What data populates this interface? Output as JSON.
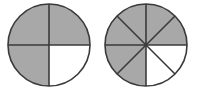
{
  "figure": {
    "background_color": "#ffffff",
    "width": 197,
    "height": 94
  },
  "style": {
    "shaded_color": "#a8a8a8",
    "unshaded_color": "#ffffff",
    "outline_color": "#3a3a3a",
    "outline_width": 1.6,
    "divider_width": 1.6
  },
  "chart_data": {
    "type": "pie",
    "xlabel": "",
    "ylabel": "",
    "legend": [
      {
        "label": "shaded",
        "color": "#a8a8a8"
      },
      {
        "label": "unshaded",
        "color": "#ffffff"
      }
    ],
    "charts": [
      {
        "name": "left-circle",
        "total_sectors": 4,
        "shaded_sectors": 3,
        "unshaded_sectors": 1,
        "fraction": "3/4",
        "value": 0.75,
        "categories": [
          "quadrant-1",
          "quadrant-2",
          "quadrant-3",
          "quadrant-4"
        ],
        "values": [
          25,
          25,
          25,
          25
        ],
        "shaded": [
          true,
          true,
          true,
          false
        ]
      },
      {
        "name": "right-circle",
        "total_sectors": 8,
        "shaded_sectors": 6,
        "unshaded_sectors": 2,
        "fraction": "6/8",
        "value": 0.75,
        "categories": [
          "eighth-1",
          "eighth-2",
          "eighth-3",
          "eighth-4",
          "eighth-5",
          "eighth-6",
          "eighth-7",
          "eighth-8"
        ],
        "values": [
          12.5,
          12.5,
          12.5,
          12.5,
          12.5,
          12.5,
          12.5,
          12.5
        ],
        "shaded": [
          true,
          true,
          false,
          false,
          true,
          true,
          true,
          true
        ]
      }
    ]
  },
  "circles": [
    {
      "id": "left-circle",
      "label": "three-fourths-circle",
      "cx": 49,
      "cy": 45,
      "r": 41,
      "sector_count": 4,
      "start_angle_deg": -90,
      "sectors": [
        {
          "id": "left-sector-1",
          "label": "top-right-quadrant",
          "shaded": true
        },
        {
          "id": "left-sector-2",
          "label": "bottom-right-quadrant",
          "shaded": false
        },
        {
          "id": "left-sector-3",
          "label": "bottom-left-quadrant",
          "shaded": true
        },
        {
          "id": "left-sector-4",
          "label": "top-left-quadrant",
          "shaded": true
        }
      ]
    },
    {
      "id": "right-circle",
      "label": "six-eighths-circle",
      "cx": 146,
      "cy": 45,
      "r": 41,
      "sector_count": 8,
      "start_angle_deg": -90,
      "sectors": [
        {
          "id": "right-sector-1",
          "label": "upper-right-eighth-a",
          "shaded": true
        },
        {
          "id": "right-sector-2",
          "label": "upper-right-eighth-b",
          "shaded": true
        },
        {
          "id": "right-sector-3",
          "label": "lower-right-eighth-a",
          "shaded": false
        },
        {
          "id": "right-sector-4",
          "label": "lower-right-eighth-b",
          "shaded": false
        },
        {
          "id": "right-sector-5",
          "label": "lower-left-eighth-a",
          "shaded": true
        },
        {
          "id": "right-sector-6",
          "label": "lower-left-eighth-b",
          "shaded": true
        },
        {
          "id": "right-sector-7",
          "label": "upper-left-eighth-a",
          "shaded": true
        },
        {
          "id": "right-sector-8",
          "label": "upper-left-eighth-b",
          "shaded": true
        }
      ]
    }
  ]
}
